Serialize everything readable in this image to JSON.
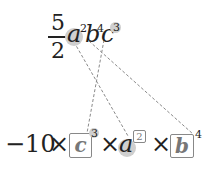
{
  "top_expression": {
    "fraction": {
      "numerator": "5",
      "denominator": "2"
    },
    "terms": [
      {
        "base": "a",
        "exponent": "2",
        "highlight": "base"
      },
      {
        "base": "b",
        "exponent": "4",
        "highlight": "none"
      },
      {
        "base": "c",
        "exponent": "3",
        "highlight": "exponent"
      }
    ]
  },
  "bottom_expression": {
    "coefficient": "−10",
    "times": "×",
    "terms": [
      {
        "base": "c",
        "exponent": "3",
        "style": "boxed-base"
      },
      {
        "base": "a",
        "exponent": "2",
        "style": "highlighted-base-boxed-exponent"
      },
      {
        "base": "b",
        "exponent": "4",
        "style": "boxed-base"
      }
    ]
  },
  "connectors": [
    {
      "from": "top-a",
      "to": "bottom-a",
      "style": "dashed"
    },
    {
      "from": "top-b",
      "to": "bottom-b",
      "style": "dashed"
    },
    {
      "from": "top-c",
      "to": "bottom-c",
      "style": "dashed"
    }
  ],
  "colors": {
    "highlight": "#cfcfcf",
    "box_border": "#888888",
    "line": "#888888",
    "text": "#222222"
  }
}
